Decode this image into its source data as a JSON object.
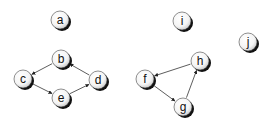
{
  "diagram": {
    "type": "directed-graph",
    "nodes": [
      {
        "id": "a",
        "label": "a",
        "x": 60,
        "y": 20
      },
      {
        "id": "b",
        "label": "b",
        "x": 61,
        "y": 59
      },
      {
        "id": "c",
        "label": "c",
        "x": 23,
        "y": 79
      },
      {
        "id": "d",
        "label": "d",
        "x": 98,
        "y": 80
      },
      {
        "id": "e",
        "label": "e",
        "x": 61,
        "y": 98
      },
      {
        "id": "f",
        "label": "f",
        "x": 145,
        "y": 79
      },
      {
        "id": "g",
        "label": "g",
        "x": 183,
        "y": 107
      },
      {
        "id": "h",
        "label": "h",
        "x": 200,
        "y": 61
      },
      {
        "id": "i",
        "label": "i",
        "x": 182,
        "y": 21
      },
      {
        "id": "j",
        "label": "j",
        "x": 248,
        "y": 42
      }
    ],
    "edges": [
      {
        "from": "b",
        "to": "c"
      },
      {
        "from": "c",
        "to": "e"
      },
      {
        "from": "e",
        "to": "d"
      },
      {
        "from": "d",
        "to": "b"
      },
      {
        "from": "h",
        "to": "f"
      },
      {
        "from": "f",
        "to": "g"
      },
      {
        "from": "g",
        "to": "h"
      }
    ]
  }
}
